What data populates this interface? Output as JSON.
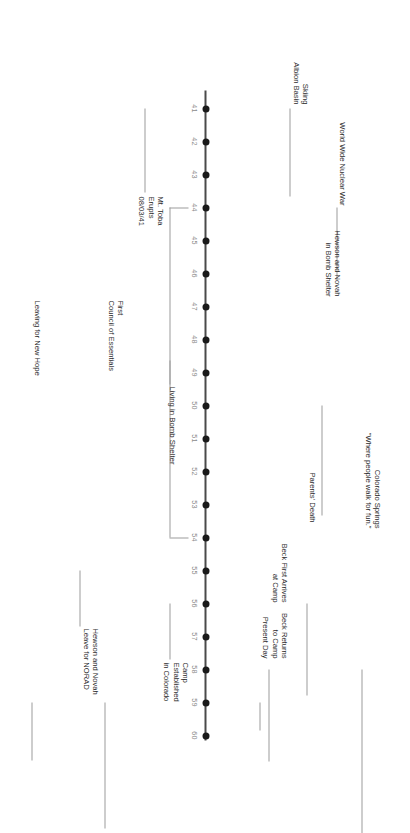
{
  "diagram": {
    "type": "timeline",
    "title": "",
    "orientation": "vertical-rotated",
    "axis": {
      "start_label": "41",
      "end_label": "60",
      "tick_labels": [
        "41",
        "42",
        "43",
        "44",
        "45",
        "46",
        "47",
        "48",
        "49",
        "50",
        "51",
        "52",
        "53",
        "54",
        "55",
        "56",
        "57",
        "58",
        "59",
        "60"
      ]
    },
    "events": [
      {
        "id": "mt-toba",
        "year": "41",
        "side": "right",
        "lines": [
          "Mt. Toba",
          "Erupts",
          "08/03/41"
        ]
      },
      {
        "id": "skiing-albion",
        "year": "41",
        "side": "left",
        "lines": [
          "Skiing",
          "Albion Basin"
        ]
      },
      {
        "id": "nuclear-war",
        "year": "44",
        "side": "left",
        "lines": [
          "World Wide Nuclear War"
        ]
      },
      {
        "id": "bomb-shelter",
        "year": "50",
        "side": "left",
        "lines": [
          "Hewson and Novah",
          "in Bomb Shelter"
        ]
      },
      {
        "id": "leave-norad",
        "year": "55",
        "side": "right",
        "lines": [
          "Hewson and Novah",
          "Leave for NORAD"
        ]
      },
      {
        "id": "camp-established",
        "year": "56",
        "side": "right",
        "lines": [
          "Camp",
          "Established",
          "in Colorado"
        ]
      },
      {
        "id": "parents-death",
        "year": "56",
        "side": "left",
        "lines": [
          "Parents' Death"
        ]
      },
      {
        "id": "colorado-springs",
        "year": "58",
        "side": "left",
        "lines": [
          "Colorado Springs",
          "\"Where people walk for fun.\""
        ]
      },
      {
        "id": "beck-first-arrives",
        "year": "58",
        "side": "left",
        "lines": [
          "Beck First Arrives",
          "at Camp"
        ]
      },
      {
        "id": "first-council",
        "year": "59",
        "side": "right",
        "lines": [
          "First",
          "Council of Essentials"
        ]
      },
      {
        "id": "leaving-new-hope",
        "year": "59",
        "side": "right",
        "lines": [
          "Leaving for New Hope"
        ]
      },
      {
        "id": "beck-returns",
        "year": "59",
        "side": "left",
        "lines": [
          "Beck Returns",
          "to Camp",
          "Present Day"
        ]
      }
    ],
    "spans": [
      {
        "id": "living-in-bomb-shelter",
        "label": "Living in Bomb Shelter",
        "from_year": "44",
        "to_year": "54"
      }
    ],
    "colors": {
      "axis": "#4a4a4a",
      "tick": "#1a1a1a",
      "tick_label": "#8a8a8a",
      "leader": "#9c9c9c",
      "text": "#2b2b2b",
      "background": "#ffffff"
    }
  }
}
